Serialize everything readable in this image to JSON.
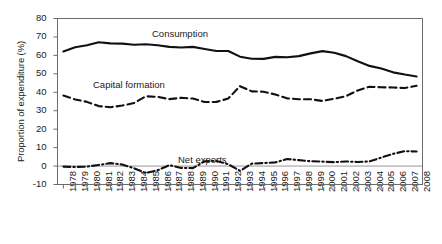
{
  "chart_data": {
    "type": "line",
    "title": "",
    "xlabel": "",
    "ylabel": "Proportion of expenditure (%)",
    "ylim": [
      -10,
      80
    ],
    "ytick_values": [
      80,
      70,
      60,
      50,
      40,
      30,
      20,
      10,
      0,
      -10
    ],
    "ytick_labels": [
      "80",
      "70",
      "60",
      "50",
      "40",
      "30",
      "20",
      "10",
      "0",
      "-10"
    ],
    "grid": false,
    "legend_position": "inline-annotations",
    "zero_line": true,
    "categories": [
      "1978",
      "1979",
      "1980",
      "1981",
      "1982",
      "1983",
      "1984",
      "1985",
      "1986",
      "1987",
      "1988",
      "1989",
      "1990",
      "1991",
      "1992",
      "1993",
      "1994",
      "1995",
      "1996",
      "1997",
      "1998",
      "1999",
      "2000",
      "2001",
      "2002",
      "2003",
      "2004",
      "2005",
      "2006",
      "2007",
      "2008"
    ],
    "series": [
      {
        "name": "Consumption",
        "style": "solid",
        "color": "#111111",
        "values": [
          62.1,
          64.4,
          65.5,
          67.1,
          66.5,
          66.4,
          65.8,
          66.0,
          65.5,
          64.6,
          64.3,
          64.6,
          63.5,
          62.4,
          62.4,
          59.3,
          58.2,
          58.1,
          59.2,
          59.0,
          59.6,
          61.1,
          62.3,
          61.4,
          59.6,
          56.8,
          54.3,
          52.9,
          50.8,
          49.6,
          48.6
        ]
      },
      {
        "name": "Capital formation",
        "style": "dashed",
        "color": "#111111",
        "values": [
          38.2,
          36.1,
          34.8,
          32.5,
          31.9,
          32.8,
          34.2,
          37.8,
          37.5,
          36.3,
          37.0,
          36.6,
          34.7,
          34.8,
          36.6,
          43.3,
          40.5,
          40.3,
          38.8,
          36.7,
          36.2,
          36.2,
          35.3,
          36.5,
          37.9,
          41.0,
          43.0,
          42.7,
          42.6,
          42.3,
          43.5
        ]
      },
      {
        "name": "Net exports",
        "style": "dash-dot",
        "color": "#111111",
        "values": [
          -0.3,
          -0.5,
          -0.3,
          0.6,
          1.6,
          0.8,
          -1.2,
          -3.8,
          -2.3,
          0.5,
          -1.0,
          -1.1,
          2.6,
          2.8,
          1.0,
          -2.6,
          1.3,
          1.6,
          2.0,
          3.8,
          3.2,
          2.6,
          2.4,
          2.1,
          2.5,
          2.2,
          2.5,
          4.6,
          6.6,
          8.1,
          7.9
        ]
      }
    ],
    "annotations": [
      {
        "text": "Consumption",
        "series": "Consumption"
      },
      {
        "text": "Capital formation",
        "series": "Capital formation"
      },
      {
        "text": "Net exports",
        "series": "Net exports"
      }
    ]
  }
}
